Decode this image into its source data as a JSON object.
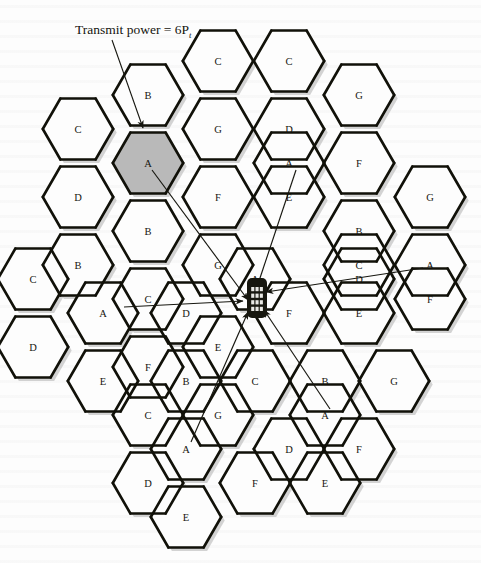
{
  "figure": {
    "caption": "Transmit power = 6P",
    "caption_sub": "t",
    "caption_full": "Transmit power = 6P_t",
    "type": "cellular-frequency-reuse-diagram",
    "cluster_size": 7,
    "channel_labels": [
      "A",
      "B",
      "C",
      "D",
      "E",
      "F",
      "G"
    ],
    "colors": {
      "ink": "#16160f",
      "highlight_fill": "#b9b9b9",
      "cell_fill": "#fdfdfd",
      "thin_line": "#2a2a24",
      "thick_line": "#111109",
      "shadow": "#b0b0b0"
    },
    "highlighted_cell": "A",
    "mobile_device": {
      "name": "mobile-handset",
      "keypad_rows": 4,
      "keypad_cols": 3
    },
    "cells": [
      {
        "label": "B",
        "cx": 148,
        "cy": 95
      },
      {
        "label": "C",
        "cx": 289,
        "cy": 61
      },
      {
        "label": "C",
        "cx": 78,
        "cy": 129
      },
      {
        "label": "G",
        "cx": 218,
        "cy": 129
      },
      {
        "label": "C",
        "cx": 218,
        "cy": 61
      },
      {
        "label": "G",
        "cx": 359,
        "cy": 95
      },
      {
        "label": "A",
        "cx": 148,
        "cy": 163,
        "highlight": true
      },
      {
        "label": "D",
        "cx": 78,
        "cy": 197
      },
      {
        "label": "F",
        "cx": 218,
        "cy": 197
      },
      {
        "label": "D",
        "cx": 289,
        "cy": 129
      },
      {
        "label": "A",
        "cx": 289,
        "cy": 163
      },
      {
        "label": "F",
        "cx": 359,
        "cy": 163
      },
      {
        "label": "E",
        "cx": 289,
        "cy": 197
      },
      {
        "label": "B",
        "cx": 148,
        "cy": 231
      },
      {
        "label": "E",
        "cx": 148,
        "cy": 231
      },
      {
        "label": "B",
        "cx": 359,
        "cy": 231
      },
      {
        "label": "G",
        "cx": 430,
        "cy": 197
      },
      {
        "label": "B",
        "cx": 78,
        "cy": 265
      },
      {
        "label": "C",
        "cx": 148,
        "cy": 299
      },
      {
        "label": "G",
        "cx": 218,
        "cy": 265
      },
      {
        "label": "C",
        "cx": 359,
        "cy": 265
      },
      {
        "label": "A",
        "cx": 430,
        "cy": 265
      },
      {
        "label": "F",
        "cx": 430,
        "cy": 299
      },
      {
        "label": "A",
        "cx": 103,
        "cy": 313
      },
      {
        "label": "C",
        "cx": 33,
        "cy": 279
      },
      {
        "label": "D",
        "cx": 33,
        "cy": 347
      },
      {
        "label": "D",
        "cx": 186,
        "cy": 313
      },
      {
        "label": "A",
        "cx": 255,
        "cy": 279
      },
      {
        "label": "F",
        "cx": 289,
        "cy": 313
      },
      {
        "label": "E",
        "cx": 359,
        "cy": 313
      },
      {
        "label": "D",
        "cx": 359,
        "cy": 279
      },
      {
        "label": "F",
        "cx": 148,
        "cy": 367
      },
      {
        "label": "E",
        "cx": 103,
        "cy": 381
      },
      {
        "label": "E",
        "cx": 218,
        "cy": 347
      },
      {
        "label": "B",
        "cx": 186,
        "cy": 381
      },
      {
        "label": "B",
        "cx": 325,
        "cy": 381
      },
      {
        "label": "C",
        "cx": 255,
        "cy": 381
      },
      {
        "label": "G",
        "cx": 394,
        "cy": 381
      },
      {
        "label": "C",
        "cx": 148,
        "cy": 415
      },
      {
        "label": "G",
        "cx": 218,
        "cy": 415
      },
      {
        "label": "A",
        "cx": 325,
        "cy": 415
      },
      {
        "label": "A",
        "cx": 186,
        "cy": 449
      },
      {
        "label": "D",
        "cx": 289,
        "cy": 449
      },
      {
        "label": "F",
        "cx": 359,
        "cy": 449
      },
      {
        "label": "D",
        "cx": 148,
        "cy": 483
      },
      {
        "label": "F",
        "cx": 255,
        "cy": 483
      },
      {
        "label": "E",
        "cx": 325,
        "cy": 483
      },
      {
        "label": "E",
        "cx": 186,
        "cy": 517
      }
    ],
    "interferer_arrows": [
      {
        "from_label": "A",
        "from_x": 152,
        "from_y": 170,
        "to_x": 248,
        "to_y": 300
      },
      {
        "from_label": "A",
        "from_x": 296,
        "from_y": 170,
        "to_x": 257,
        "to_y": 287
      },
      {
        "from_label": "A",
        "from_x": 124,
        "from_y": 307,
        "to_x": 243,
        "to_y": 301
      },
      {
        "from_label": "A",
        "from_x": 423,
        "from_y": 268,
        "to_x": 266,
        "to_y": 292
      },
      {
        "from_label": "A",
        "from_x": 330,
        "from_y": 409,
        "to_x": 264,
        "to_y": 310
      },
      {
        "from_label": "A",
        "from_x": 191,
        "from_y": 442,
        "to_x": 248,
        "to_y": 312
      }
    ]
  }
}
